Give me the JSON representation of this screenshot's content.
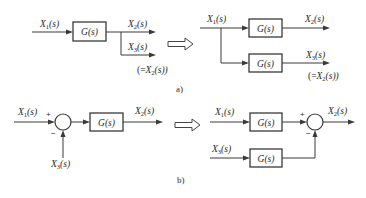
{
  "diagram": {
    "part_a": {
      "caption": "a)",
      "left": {
        "input_label": {
          "base": "X",
          "sub": "1",
          "arg": "(s)"
        },
        "block": "G(s)",
        "output1_label": {
          "base": "X",
          "sub": "2",
          "arg": "(s)"
        },
        "output2_label": {
          "base": "X",
          "sub": "3",
          "arg": "(s)"
        },
        "note": {
          "pre": "(=",
          "base": "X",
          "sub": "2",
          "arg": "(s))"
        }
      },
      "right": {
        "input_label": {
          "base": "X",
          "sub": "1",
          "arg": "(s)"
        },
        "block1": "G(s)",
        "block2": "G(s)",
        "output1_label": {
          "base": "X",
          "sub": "2",
          "arg": "(s)"
        },
        "output2_label": {
          "base": "X",
          "sub": "3",
          "arg": "(s)"
        },
        "note": {
          "pre": "(=",
          "base": "X",
          "sub": "2",
          "arg": "(s))"
        }
      }
    },
    "part_b": {
      "caption": "b)",
      "left": {
        "input_label": {
          "base": "X",
          "sub": "1",
          "arg": "(s)"
        },
        "plus": "+",
        "minus": "−",
        "feed_label": {
          "base": "X",
          "sub": "3",
          "arg": "(s)"
        },
        "block": "G(s)",
        "output_label": {
          "base": "X",
          "sub": "2",
          "arg": "(s)"
        }
      },
      "right": {
        "input1_label": {
          "base": "X",
          "sub": "1",
          "arg": "(s)"
        },
        "input2_label": {
          "base": "X",
          "sub": "3",
          "arg": "(s)"
        },
        "block1": "G(s)",
        "block2": "G(s)",
        "plus": "+",
        "minus": "−",
        "output_label": {
          "base": "X",
          "sub": "2",
          "arg": "(s)"
        }
      }
    },
    "transform_arrow": "hollow-right-arrow"
  }
}
